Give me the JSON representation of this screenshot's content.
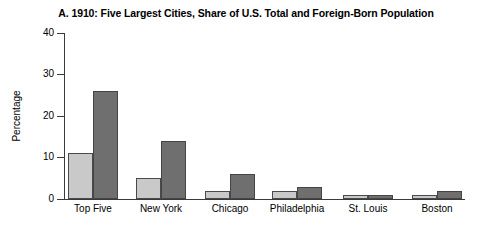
{
  "chart_data": {
    "type": "bar",
    "title": "A. 1910: Five Largest Cities, Share of U.S. Total and Foreign-Born Population",
    "xlabel": "",
    "ylabel": "Percentage",
    "ylim": [
      0,
      42
    ],
    "yticks": [
      0,
      10,
      20,
      30,
      40
    ],
    "grid": false,
    "legend": "none",
    "categories": [
      "Top Five",
      "New York",
      "Chicago",
      "Philadelphia",
      "St. Louis",
      "Boston"
    ],
    "series": [
      {
        "name": "Share of U.S. Total Population",
        "color": "#c9c9c9",
        "values": [
          11,
          5,
          2,
          2,
          1,
          1
        ]
      },
      {
        "name": "Share of U.S. Foreign-Born Population",
        "color": "#6f6f6f",
        "values": [
          26,
          14,
          6,
          3,
          1,
          2
        ]
      }
    ]
  },
  "axis": {
    "tick_labels": [
      "0",
      "10",
      "20",
      "30",
      "40"
    ]
  }
}
